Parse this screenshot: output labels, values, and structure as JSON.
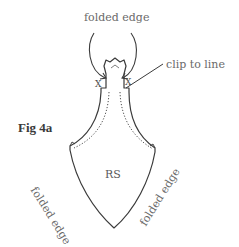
{
  "figure": {
    "title": "Fig 4a",
    "labels": {
      "top_fold": "folded edge",
      "clip": "clip to line",
      "center": "RS",
      "left_fold": "folded edge",
      "right_fold": "folded edge"
    },
    "marks": {
      "left_x": "X",
      "right_x": "X"
    },
    "colors": {
      "line": "#3a3a3a",
      "text": "#6a6a6a"
    }
  }
}
